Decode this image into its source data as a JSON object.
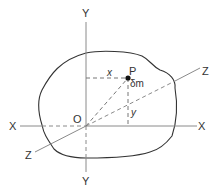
{
  "diagram": {
    "type": "3d-axes-body",
    "axes": {
      "y_top": "Y",
      "y_bottom": "Y",
      "x_left": "X",
      "x_right": "X",
      "z_upper": "Z",
      "z_lower": "Z"
    },
    "origin_label": "O",
    "point_label": "P",
    "mass_label": "δm",
    "x_distance_label": "x",
    "y_distance_label": "y",
    "colors": {
      "axis": "#8a8a8a",
      "outline": "#333333",
      "dashed": "#777777",
      "point": "#111111",
      "text": "#333333"
    }
  }
}
